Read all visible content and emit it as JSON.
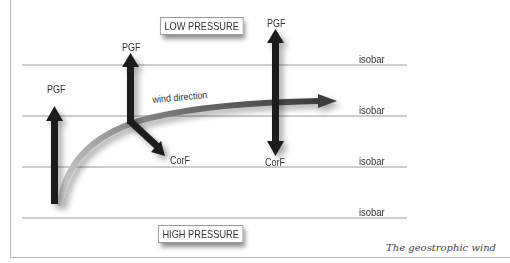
{
  "diagram": {
    "title": "The geostrophic wind",
    "pressure_labels": {
      "low": "LOW PRESSURE",
      "high": "HIGH PRESSURE"
    },
    "isobars": [
      {
        "label": "isobar",
        "y": 65
      },
      {
        "label": "isobar",
        "y": 116
      },
      {
        "label": "isobar",
        "y": 167
      },
      {
        "label": "isobar",
        "y": 218
      }
    ],
    "force_labels": {
      "pgf_left": "PGF",
      "pgf_middle": "PGF",
      "pgf_right": "PGF",
      "corf_middle": "CorF",
      "corf_right": "CorF"
    },
    "wind_label": "wind direction",
    "colors": {
      "arrow": "#1c1c1c",
      "wind_path_start": "#c8c8c8",
      "wind_path_end": "#4a4a4a",
      "isobar_line": "#9a9a9a",
      "frame": "#b8b8b8"
    }
  }
}
